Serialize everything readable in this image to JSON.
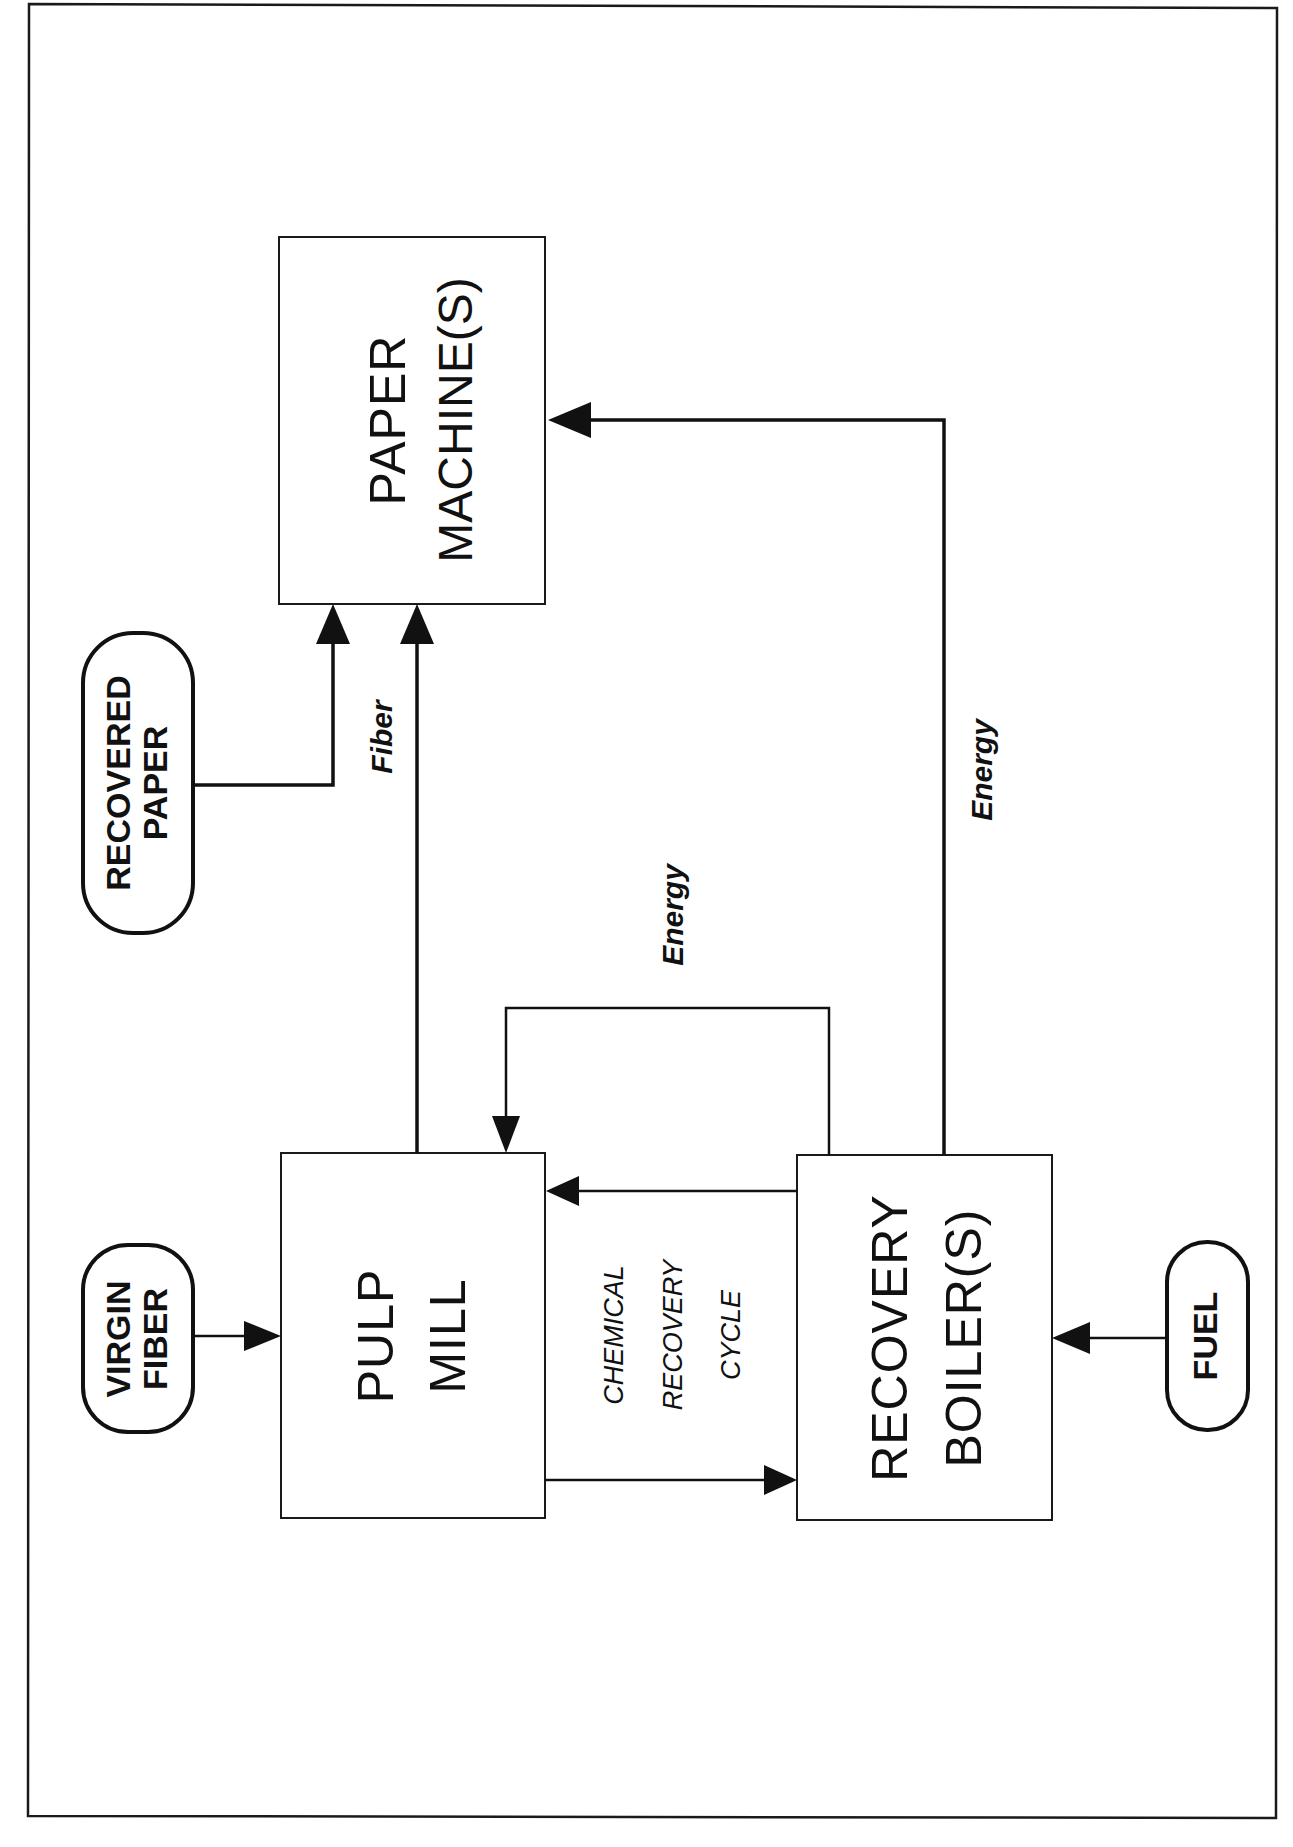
{
  "diagram": {
    "nodes": {
      "paper_machine": {
        "line1": "PAPER",
        "line2": "MACHINE(S)"
      },
      "pulp_mill": {
        "line1": "PULP",
        "line2": "MILL"
      },
      "recovery_boiler": {
        "line1": "RECOVERY",
        "line2": "BOILER(S)"
      }
    },
    "inputs": {
      "recovered_paper": {
        "line1": "RECOVERED",
        "line2": "PAPER"
      },
      "virgin_fiber": {
        "line1": "VIRGIN",
        "line2": "FIBER"
      },
      "fuel": {
        "line1": "FUEL"
      }
    },
    "flow_labels": {
      "fiber": "Fiber",
      "energy_to_pulp_mill": "Energy",
      "energy_to_paper_machine": "Energy"
    },
    "cycle_label": {
      "line1": "CHEMICAL",
      "line2": "RECOVERY",
      "line3": "CYCLE"
    },
    "edges": [
      {
        "from": "virgin_fiber",
        "to": "pulp_mill"
      },
      {
        "from": "recovered_paper",
        "to": "paper_machine"
      },
      {
        "from": "pulp_mill",
        "to": "paper_machine",
        "label": "Fiber"
      },
      {
        "from": "recovery_boiler",
        "to": "pulp_mill",
        "label": "Energy"
      },
      {
        "from": "recovery_boiler",
        "to": "paper_machine",
        "label": "Energy"
      },
      {
        "from": "pulp_mill",
        "to": "recovery_boiler",
        "label": "Chemical Recovery Cycle"
      },
      {
        "from": "recovery_boiler",
        "to": "pulp_mill",
        "label": "Chemical Recovery Cycle"
      },
      {
        "from": "fuel",
        "to": "recovery_boiler"
      }
    ]
  }
}
